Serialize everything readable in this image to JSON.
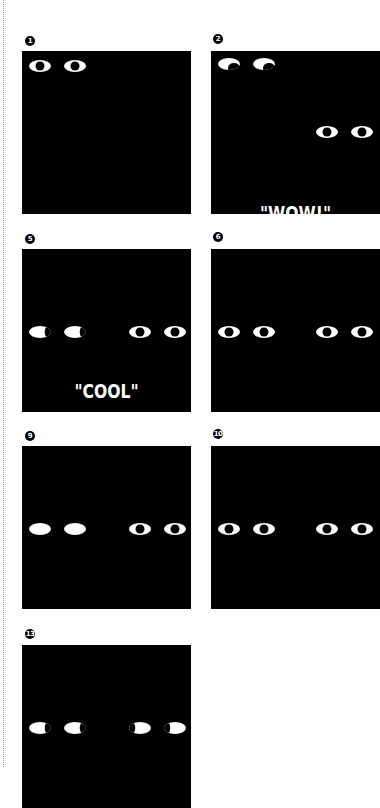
{
  "page": {
    "background": "#ffffff",
    "panel_color": "#000000",
    "eye_color": "#ffffff"
  },
  "panels": [
    {
      "number": "1",
      "caption": "",
      "eyes": [
        {
          "type": "open",
          "x": 18,
          "y": 15
        },
        {
          "type": "open",
          "x": 53,
          "y": 15
        }
      ]
    },
    {
      "number": "2",
      "caption": "\"WOW!\"",
      "eyes": [
        {
          "type": "glance",
          "x": 18,
          "y": 13
        },
        {
          "type": "glance",
          "x": 53,
          "y": 13
        },
        {
          "type": "open",
          "x": 116,
          "y": 81
        },
        {
          "type": "open",
          "x": 151,
          "y": 81
        }
      ]
    },
    {
      "number": "5",
      "caption": "\"COOL\"",
      "eyes": [
        {
          "type": "crescent-left",
          "x": 18,
          "y": 83
        },
        {
          "type": "crescent-left",
          "x": 53,
          "y": 83
        },
        {
          "type": "open",
          "x": 118,
          "y": 83
        },
        {
          "type": "open",
          "x": 153,
          "y": 83
        }
      ]
    },
    {
      "number": "6",
      "caption": "",
      "eyes": [
        {
          "type": "open",
          "x": 18,
          "y": 83
        },
        {
          "type": "open",
          "x": 53,
          "y": 83
        },
        {
          "type": "open",
          "x": 116,
          "y": 83
        },
        {
          "type": "open",
          "x": 151,
          "y": 83
        }
      ]
    },
    {
      "number": "9",
      "caption": "",
      "eyes": [
        {
          "type": "solid",
          "x": 18,
          "y": 83
        },
        {
          "type": "solid",
          "x": 53,
          "y": 83
        },
        {
          "type": "open",
          "x": 118,
          "y": 83
        },
        {
          "type": "open",
          "x": 153,
          "y": 83
        }
      ]
    },
    {
      "number": "10",
      "caption": "",
      "eyes": [
        {
          "type": "open",
          "x": 18,
          "y": 83
        },
        {
          "type": "open",
          "x": 53,
          "y": 83
        },
        {
          "type": "open",
          "x": 116,
          "y": 83
        },
        {
          "type": "open",
          "x": 151,
          "y": 83
        }
      ]
    },
    {
      "number": "13",
      "caption": "",
      "eyes": [
        {
          "type": "crescent-left",
          "x": 18,
          "y": 83
        },
        {
          "type": "crescent-left",
          "x": 53,
          "y": 83
        },
        {
          "type": "crescent-right",
          "x": 118,
          "y": 83
        },
        {
          "type": "crescent-right",
          "x": 153,
          "y": 83
        }
      ]
    }
  ]
}
